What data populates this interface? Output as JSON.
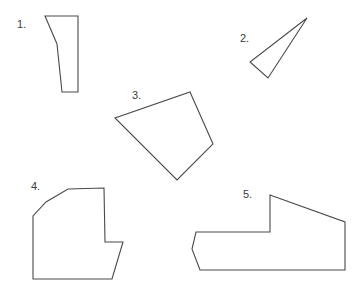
{
  "canvas": {
    "width": 358,
    "height": 289,
    "background": "#ffffff",
    "stroke_color": "#4a4a4a",
    "fill_color": "#ffffff",
    "label_color": "#3b3b3b",
    "stroke_width": 1.1
  },
  "shapes": [
    {
      "id": "shape-1",
      "label": "1.",
      "label_x": 17,
      "label_y": 19,
      "vertex_count": 5,
      "points": "45,16 78,16 78,92 62,92 57,44",
      "description": "narrow elongated pentagon, upper left"
    },
    {
      "id": "shape-2",
      "label": "2.",
      "label_x": 240,
      "label_y": 33,
      "vertex_count": 3,
      "points": "307,18 250,62 268,78",
      "description": "thin sliver triangle, upper right"
    },
    {
      "id": "shape-3",
      "label": "3.",
      "label_x": 132,
      "label_y": 90,
      "vertex_count": 4,
      "points": "190,92 213,144 177,180 115,118",
      "description": "tilted quadrilateral, center"
    },
    {
      "id": "shape-4",
      "label": "4.",
      "label_x": 31,
      "label_y": 181,
      "vertex_count": 8,
      "points": "104,188 105,242 123,242 112,279 33,279 33,216 46,202 68,189",
      "description": "notched polygon, lower left"
    },
    {
      "id": "shape-5",
      "label": "5.",
      "label_x": 243,
      "label_y": 189,
      "vertex_count": 7,
      "points": "270,195 345,222 345,270 200,270 192,249 196,232 270,232",
      "description": "notched polygon, lower right"
    }
  ]
}
